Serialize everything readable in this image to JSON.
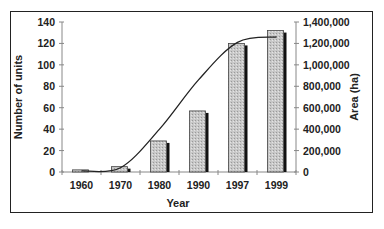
{
  "chart_data": {
    "type": "bar",
    "title": "",
    "xlabel": "Year",
    "ylabel": "Number of units",
    "y2label": "Area (ha)",
    "categories": [
      "1960",
      "1970",
      "1980",
      "1990",
      "1997",
      "1999"
    ],
    "series": [
      {
        "name": "Number of units",
        "type": "bar",
        "axis": "left",
        "values": [
          2,
          5,
          29,
          57,
          120,
          132
        ]
      },
      {
        "name": "Area (ha)",
        "type": "line",
        "axis": "right",
        "values": [
          10000,
          40000,
          400000,
          860000,
          1210000,
          1260000
        ]
      }
    ],
    "ylim": [
      0,
      140
    ],
    "y2lim": [
      0,
      1400000
    ],
    "yticks": [
      "0",
      "20",
      "40",
      "60",
      "80",
      "100",
      "120",
      "140"
    ],
    "y2ticks": [
      "0",
      "200,000",
      "400,000",
      "600,000",
      "800,000",
      "1,000,000",
      "1,200,000",
      "1,400,000"
    ],
    "grid": false,
    "legend": "none"
  },
  "colors": {
    "bar_fill": "#c8c8c8",
    "bar_shadow": "#111111",
    "line": "#222222",
    "axis": "#888888",
    "frame": "#222222"
  }
}
